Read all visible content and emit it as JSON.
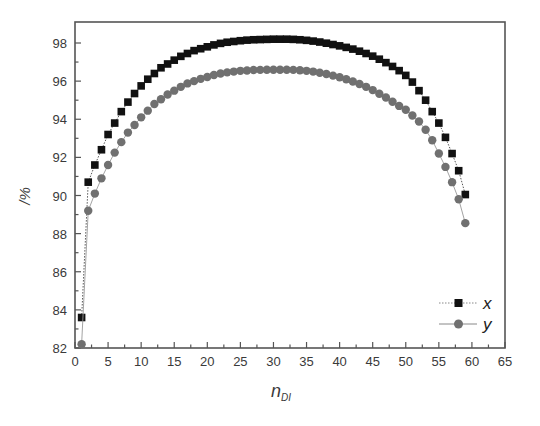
{
  "chart_data": {
    "type": "line",
    "title": "",
    "xlabel": "n_DI",
    "xlabel_main": "n",
    "xlabel_sub": "DI",
    "ylabel": "/%",
    "xlim": [
      0,
      65
    ],
    "ylim": [
      82,
      99
    ],
    "xticks": [
      0,
      5,
      10,
      15,
      20,
      25,
      30,
      35,
      40,
      45,
      50,
      55,
      60,
      65
    ],
    "yticks": [
      82,
      84,
      86,
      88,
      90,
      92,
      94,
      96,
      98
    ],
    "grid": false,
    "legend_position": "lower right",
    "x": [
      1,
      2,
      3,
      4,
      5,
      6,
      7,
      8,
      9,
      10,
      11,
      12,
      13,
      14,
      15,
      16,
      17,
      18,
      19,
      20,
      21,
      22,
      23,
      24,
      25,
      26,
      27,
      28,
      29,
      30,
      31,
      32,
      33,
      34,
      35,
      36,
      37,
      38,
      39,
      40,
      41,
      42,
      43,
      44,
      45,
      46,
      47,
      48,
      49,
      50,
      51,
      52,
      53,
      54,
      55,
      56,
      57,
      58,
      59
    ],
    "series": [
      {
        "name": "x",
        "marker": "square",
        "color": "#111111",
        "line_style": "dotted",
        "values": [
          83.6,
          90.7,
          91.6,
          92.4,
          93.2,
          93.8,
          94.4,
          94.9,
          95.35,
          95.75,
          96.1,
          96.4,
          96.7,
          96.9,
          97.1,
          97.3,
          97.45,
          97.6,
          97.7,
          97.8,
          97.9,
          97.98,
          98.04,
          98.08,
          98.12,
          98.15,
          98.17,
          98.18,
          98.19,
          98.2,
          98.2,
          98.2,
          98.19,
          98.17,
          98.14,
          98.1,
          98.05,
          97.99,
          97.92,
          97.85,
          97.77,
          97.68,
          97.57,
          97.45,
          97.31,
          97.15,
          96.97,
          96.77,
          96.55,
          96.3,
          95.95,
          95.5,
          95.0,
          94.4,
          93.8,
          93.05,
          92.2,
          91.3,
          90.05
        ]
      },
      {
        "name": "y",
        "marker": "circle",
        "color": "#707070",
        "line_style": "solid",
        "values": [
          82.2,
          89.2,
          90.1,
          90.9,
          91.6,
          92.25,
          92.8,
          93.3,
          93.7,
          94.1,
          94.45,
          94.8,
          95.05,
          95.3,
          95.5,
          95.7,
          95.88,
          96.0,
          96.12,
          96.22,
          96.32,
          96.4,
          96.46,
          96.5,
          96.54,
          96.56,
          96.58,
          96.59,
          96.6,
          96.6,
          96.6,
          96.6,
          96.59,
          96.57,
          96.54,
          96.5,
          96.44,
          96.37,
          96.29,
          96.2,
          96.1,
          95.98,
          95.85,
          95.7,
          95.53,
          95.34,
          95.14,
          94.92,
          94.7,
          94.5,
          94.2,
          93.88,
          93.45,
          92.9,
          92.2,
          91.5,
          90.7,
          89.8,
          88.55
        ]
      }
    ]
  }
}
